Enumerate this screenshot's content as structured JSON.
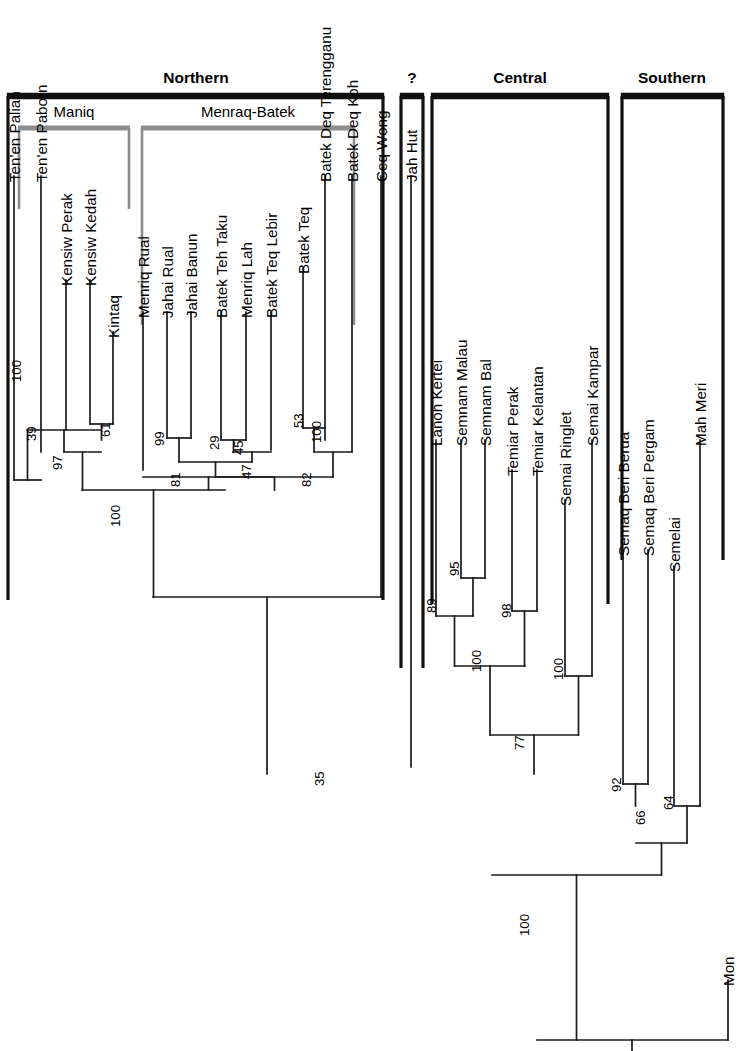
{
  "figure": {
    "kind": "phylogenetic-tree",
    "orientation": "rotated-90-leaves-at-top",
    "width": 748,
    "height": 1051,
    "line_color": "#1a1a1a",
    "bracket_outer_color": "#111111",
    "bracket_inner_color": "#8c8c8c"
  },
  "groups": [
    {
      "id": "northern",
      "label": "Northern",
      "x1": 8,
      "x2": 383,
      "label_x": 196,
      "label_y": 83,
      "bar_y": 96,
      "drop": 600
    },
    {
      "id": "unknown",
      "label": "?",
      "x1": 401,
      "x2": 423,
      "label_x": 412,
      "label_y": 83,
      "bar_y": 96,
      "drop": 668
    },
    {
      "id": "central",
      "label": "Central",
      "x1": 432,
      "x2": 608,
      "label_x": 520,
      "label_y": 83,
      "bar_y": 96,
      "drop": 604
    },
    {
      "id": "southern",
      "label": "Southern",
      "x1": 622,
      "x2": 723,
      "label_x": 672,
      "label_y": 83,
      "bar_y": 96,
      "drop": 560
    }
  ],
  "subgroups": [
    {
      "id": "maniq",
      "label": "Maniq",
      "x1": 19,
      "x2": 129,
      "label_x": 74,
      "label_y": 117,
      "bar_y": 128,
      "drop": 209
    },
    {
      "id": "menraq-batek",
      "label": "Menraq-Batek",
      "x1": 142,
      "x2": 354,
      "label_x": 248,
      "label_y": 117,
      "bar_y": 128,
      "drop": 325
    }
  ],
  "taxa": [
    {
      "name": "Ten'en Palian",
      "x": 14,
      "tip_y": 176,
      "node_y": 480
    },
    {
      "name": "Ten'en Paborn",
      "x": 41,
      "tip_y": 176,
      "node_y": 452
    },
    {
      "name": "Kensiw Perak",
      "x": 66,
      "tip_y": 280,
      "node_y": 430
    },
    {
      "name": "Kensiw Kedah",
      "x": 90,
      "tip_y": 280,
      "node_y": 424
    },
    {
      "name": "Kintaq",
      "x": 113,
      "tip_y": 332,
      "node_y": 424
    },
    {
      "name": "Menriq Rual",
      "x": 143,
      "tip_y": 312,
      "node_y": 470
    },
    {
      "name": "Jahai Rual",
      "x": 167,
      "tip_y": 312,
      "node_y": 438
    },
    {
      "name": "Jahai Banun",
      "x": 191,
      "tip_y": 312,
      "node_y": 438
    },
    {
      "name": "Batek Teh Taku",
      "x": 221,
      "tip_y": 312,
      "node_y": 440
    },
    {
      "name": "Menriq Lah",
      "x": 246,
      "tip_y": 312,
      "node_y": 440
    },
    {
      "name": "Batek Teq Lebir",
      "x": 271,
      "tip_y": 312,
      "node_y": 450
    },
    {
      "name": "Batek Teq",
      "x": 303,
      "tip_y": 268,
      "node_y": 428
    },
    {
      "name": "Batek Deq Terengganu",
      "x": 325,
      "tip_y": 176,
      "node_y": 440
    },
    {
      "name": "Batek Deq Koh",
      "x": 352,
      "tip_y": 176,
      "node_y": 452
    },
    {
      "name": "Ceq Wong",
      "x": 381,
      "tip_y": 176,
      "node_y": 597
    },
    {
      "name": "Jah Hut",
      "x": 411,
      "tip_y": 176,
      "node_y": 767
    },
    {
      "name": "Lanoh Kertei",
      "x": 436,
      "tip_y": 440,
      "node_y": 616
    },
    {
      "name": "Semnam Malau",
      "x": 461,
      "tip_y": 440,
      "node_y": 578
    },
    {
      "name": "Semnam Bal",
      "x": 485,
      "tip_y": 440,
      "node_y": 578
    },
    {
      "name": "Temiar Perak",
      "x": 512,
      "tip_y": 470,
      "node_y": 611
    },
    {
      "name": "Temiar Kelantan",
      "x": 537,
      "tip_y": 470,
      "node_y": 611
    },
    {
      "name": "Semai Ringlet",
      "x": 565,
      "tip_y": 500,
      "node_y": 676
    },
    {
      "name": "Semai Kampar",
      "x": 592,
      "tip_y": 440,
      "node_y": 676
    },
    {
      "name": "Semaq Beri Berua",
      "x": 623,
      "tip_y": 550,
      "node_y": 784
    },
    {
      "name": "Semaq Beri Pergam",
      "x": 648,
      "tip_y": 550,
      "node_y": 784
    },
    {
      "name": "Semelai",
      "x": 674,
      "tip_y": 566,
      "node_y": 806
    },
    {
      "name": "Mah Meri",
      "x": 700,
      "tip_y": 440,
      "node_y": 806
    },
    {
      "name": "Mon",
      "x": 728,
      "tip_y": 980,
      "node_y": 1040
    }
  ],
  "internal_nodes": [
    {
      "id": "n_tenen",
      "support": "100",
      "x1": 14,
      "x2": 41,
      "y": 480,
      "stem_to": 430,
      "label_x": 21,
      "label_y": 382
    },
    {
      "id": "n_kensiw",
      "support": "61",
      "x1": 90,
      "x2": 113,
      "y": 424,
      "stem_to": 440,
      "label_x": 110,
      "label_y": 437
    },
    {
      "id": "n_maniq_a",
      "support": "39",
      "x1": 27,
      "x2": 101,
      "y": 430,
      "stem_to": 452,
      "label_x": 36,
      "label_y": 441
    },
    {
      "id": "n_maniq",
      "support": "97",
      "x1": 64,
      "x2": 101,
      "y": 452,
      "stem_to": 490,
      "label_x": 62,
      "label_y": 470
    },
    {
      "id": "n_jahai",
      "support": "99",
      "x1": 167,
      "x2": 191,
      "y": 438,
      "stem_to": 462,
      "label_x": 164,
      "label_y": 446
    },
    {
      "id": "n_bteh",
      "support": "29",
      "x1": 221,
      "x2": 246,
      "y": 440,
      "stem_to": 452,
      "label_x": 219,
      "label_y": 450
    },
    {
      "id": "n_bteh2",
      "support": "45",
      "x1": 233,
      "x2": 271,
      "y": 452,
      "stem_to": 462,
      "label_x": 243,
      "label_y": 455
    },
    {
      "id": "n_bteh3",
      "support": "47",
      "x1": 179,
      "x2": 252,
      "y": 462,
      "stem_to": 477,
      "label_x": 251,
      "label_y": 479
    },
    {
      "id": "n_bdeq",
      "support": "53",
      "x1": 303,
      "x2": 325,
      "y": 428,
      "stem_to": 452,
      "label_x": 303,
      "label_y": 428
    },
    {
      "id": "n_bdeq2",
      "support": "100",
      "x1": 314,
      "x2": 352,
      "y": 452,
      "stem_to": 477,
      "label_x": 321,
      "label_y": 443
    },
    {
      "id": "n_batek",
      "support": "82",
      "x1": 216,
      "x2": 333,
      "y": 477,
      "stem_to": 490,
      "label_x": 311,
      "label_y": 487
    },
    {
      "id": "n_mb",
      "support": "81",
      "x1": 143,
      "x2": 274,
      "y": 477,
      "stem_to": 490,
      "label_x": 180,
      "label_y": 487
    },
    {
      "id": "n_northern",
      "support": "100",
      "x1": 82,
      "x2": 225,
      "y": 490,
      "stem_to": 597,
      "label_x": 120,
      "label_y": 527
    },
    {
      "id": "n_cw_north",
      "support": "35",
      "x1": 153,
      "x2": 381,
      "y": 597,
      "stem_to": 774,
      "label_x": 324,
      "label_y": 786
    },
    {
      "id": "n_semnam",
      "support": "95",
      "x1": 461,
      "x2": 485,
      "y": 578,
      "stem_to": 616,
      "label_x": 459,
      "label_y": 576
    },
    {
      "id": "n_lanoh",
      "support": "89",
      "x1": 436,
      "x2": 473,
      "y": 616,
      "stem_to": 666,
      "label_x": 436,
      "label_y": 613
    },
    {
      "id": "n_temiar",
      "support": "98",
      "x1": 512,
      "x2": 537,
      "y": 611,
      "stem_to": 666,
      "label_x": 511,
      "label_y": 618
    },
    {
      "id": "n_cen_a",
      "support": "100",
      "x1": 455,
      "x2": 525,
      "y": 666,
      "stem_to": 735,
      "label_x": 481,
      "label_y": 672
    },
    {
      "id": "n_semai",
      "support": "100",
      "x1": 565,
      "x2": 592,
      "y": 676,
      "stem_to": 735,
      "label_x": 563,
      "label_y": 680
    },
    {
      "id": "n_central",
      "support": "77",
      "x1": 490,
      "x2": 578,
      "y": 735,
      "stem_to": 774,
      "label_x": 524,
      "label_y": 750
    },
    {
      "id": "n_semaq",
      "support": "92",
      "x1": 623,
      "x2": 648,
      "y": 784,
      "stem_to": 806,
      "label_x": 621,
      "label_y": 792
    },
    {
      "id": "n_semelai",
      "support": "64",
      "x1": 674,
      "x2": 700,
      "y": 806,
      "stem_to": 843,
      "label_x": 673,
      "label_y": 810
    },
    {
      "id": "n_southern",
      "support": "66",
      "x1": 636,
      "x2": 687,
      "y": 843,
      "stem_to": 875,
      "label_x": 645,
      "label_y": 825
    },
    {
      "id": "n_aslian",
      "support": "100",
      "x1": 492,
      "x2": 661,
      "y": 875,
      "stem_to": 1040,
      "label_x": 529,
      "label_y": 936
    }
  ],
  "root": {
    "x1": 537,
    "x2": 728,
    "y": 1040,
    "stem_x": 632,
    "stem_to": 1051
  },
  "support_values": [
    "100",
    "61",
    "39",
    "97",
    "99",
    "29",
    "45",
    "47",
    "53",
    "100",
    "82",
    "81",
    "100",
    "35",
    "95",
    "89",
    "98",
    "100",
    "100",
    "77",
    "92",
    "64",
    "66",
    "100"
  ]
}
